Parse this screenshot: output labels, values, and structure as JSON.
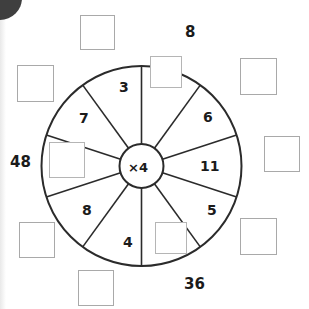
{
  "worksheet": {
    "type": "multiplication-wheel",
    "hub_label": "×4",
    "operation": "multiply",
    "factor": 4,
    "sectors": [
      {
        "index": 0,
        "position": "top-right-1",
        "kind": "empty-box",
        "value": "",
        "angle_deg": 18
      },
      {
        "index": 1,
        "position": "right-upper",
        "kind": "number",
        "value": "6",
        "angle_deg": 54
      },
      {
        "index": 2,
        "position": "right",
        "kind": "number",
        "value": "11",
        "angle_deg": 90
      },
      {
        "index": 3,
        "position": "right-lower",
        "kind": "number",
        "value": "5",
        "angle_deg": 126
      },
      {
        "index": 4,
        "position": "bottom-right",
        "kind": "empty-box",
        "value": "",
        "angle_deg": 162
      },
      {
        "index": 5,
        "position": "bottom-left",
        "kind": "number",
        "value": "4",
        "angle_deg": 198
      },
      {
        "index": 6,
        "position": "left-lower",
        "kind": "number",
        "value": "8",
        "angle_deg": 234
      },
      {
        "index": 7,
        "position": "left",
        "kind": "empty-box",
        "value": "",
        "angle_deg": 270
      },
      {
        "index": 8,
        "position": "left-upper",
        "kind": "number",
        "value": "7",
        "angle_deg": 306
      },
      {
        "index": 9,
        "position": "top-left",
        "kind": "number",
        "value": "3",
        "angle_deg": 342
      }
    ],
    "outer_labels": [
      {
        "name": "top-answer",
        "value": "8"
      },
      {
        "name": "left-answer",
        "value": "48"
      },
      {
        "name": "bottom-answer",
        "value": "36"
      }
    ],
    "outer_boxes": [
      {
        "name": "outer-box-top",
        "value": ""
      },
      {
        "name": "outer-box-top-left",
        "value": ""
      },
      {
        "name": "outer-box-top-right",
        "value": ""
      },
      {
        "name": "outer-box-right",
        "value": ""
      },
      {
        "name": "outer-box-bottom-right",
        "value": ""
      },
      {
        "name": "outer-box-bottom",
        "value": ""
      },
      {
        "name": "outer-box-bottom-left",
        "value": ""
      },
      {
        "name": "outer-box-left",
        "value": ""
      }
    ],
    "colors": {
      "ink": "#1b1b1b",
      "stroke": "#2b2b2b",
      "box_border": "#a9a9a9",
      "paper": "#ffffff",
      "blob": "#3f3f3f"
    }
  }
}
